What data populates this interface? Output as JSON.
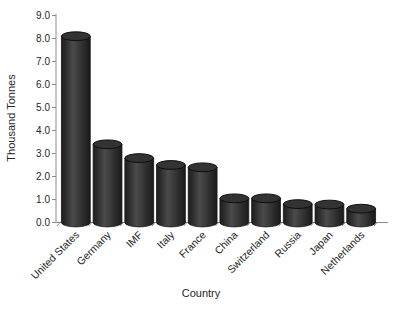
{
  "figure": {
    "background": "#ffffff"
  },
  "chart_data": {
    "type": "bar",
    "subtype": "3d-cylinder",
    "title": "",
    "xlabel": "Country",
    "ylabel": "Thousand Tonnes",
    "categories": [
      "United States",
      "Germany",
      "IMF",
      "Italy",
      "France",
      "China",
      "Switzerland",
      "Russia",
      "Japan",
      "Netherlands"
    ],
    "values": [
      8.1,
      3.4,
      2.8,
      2.5,
      2.4,
      1.05,
      1.05,
      0.8,
      0.78,
      0.6
    ],
    "ylim": [
      0,
      9
    ],
    "ytick_step": 1,
    "ytick_labels": [
      "0.0",
      "1.0",
      "2.0",
      "3.0",
      "4.0",
      "5.0",
      "6.0",
      "7.0",
      "8.0",
      "9.0"
    ],
    "grid": false,
    "legend": false,
    "x_label_rotation_deg": -45,
    "bar_color": "#3a3a3a",
    "bar_top_color": "#333333",
    "bar_edge_color": "#141414",
    "axis_color": "#8c8c8c",
    "text_color": "#262626"
  }
}
